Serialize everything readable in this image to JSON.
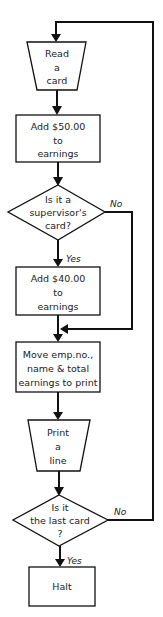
{
  "diagram": {
    "type": "flowchart",
    "colors": {
      "stroke": "#111111",
      "background": "#ffffff",
      "text": "#222222"
    },
    "nodes": [
      {
        "id": "read-card",
        "shape": "manual-input-trapezoid",
        "lines": [
          "Read",
          "a",
          "card"
        ]
      },
      {
        "id": "add-50",
        "shape": "process-box",
        "lines": [
          "Add  $50.00",
          "to",
          "earnings"
        ]
      },
      {
        "id": "supervisor-check",
        "shape": "decision-diamond",
        "lines": [
          "Is it  a",
          "supervisor's",
          "card?"
        ]
      },
      {
        "id": "add-40",
        "shape": "process-box",
        "lines": [
          "Add $40.00",
          "to",
          "earnings"
        ]
      },
      {
        "id": "move-data",
        "shape": "process-box",
        "lines": [
          "Move emp.no.,",
          "name & total",
          "earnings to print"
        ]
      },
      {
        "id": "print-line",
        "shape": "manual-input-trapezoid",
        "lines": [
          "Print",
          "a",
          "line"
        ]
      },
      {
        "id": "last-card-check",
        "shape": "decision-diamond",
        "lines": [
          "Is it",
          "the  last card",
          "?"
        ]
      },
      {
        "id": "halt",
        "shape": "process-box",
        "lines": [
          "Halt"
        ]
      }
    ],
    "edges": [
      {
        "from": "read-card",
        "to": "add-50",
        "label": ""
      },
      {
        "from": "add-50",
        "to": "supervisor-check",
        "label": ""
      },
      {
        "from": "supervisor-check",
        "to": "add-40",
        "label": "Yes"
      },
      {
        "from": "supervisor-check",
        "to": "move-data",
        "label": "No"
      },
      {
        "from": "add-40",
        "to": "move-data",
        "label": ""
      },
      {
        "from": "move-data",
        "to": "print-line",
        "label": ""
      },
      {
        "from": "print-line",
        "to": "last-card-check",
        "label": ""
      },
      {
        "from": "last-card-check",
        "to": "halt",
        "label": "Yes"
      },
      {
        "from": "last-card-check",
        "to": "read-card",
        "label": "No"
      }
    ]
  }
}
